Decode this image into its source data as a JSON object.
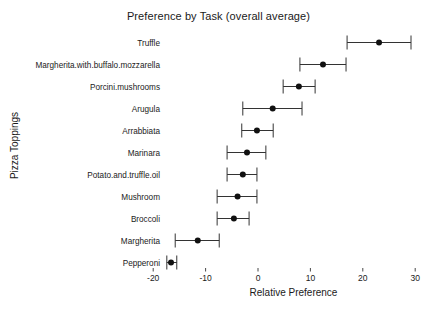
{
  "chart_data": {
    "type": "scatter",
    "title": "Preference by Task (overall average)",
    "xlabel": "Relative Preference",
    "ylabel": "Pizza Toppings",
    "xlim": [
      -22,
      31
    ],
    "xticks": [
      -20,
      -10,
      0,
      10,
      20,
      30
    ],
    "xtick_labels": [
      "-20",
      "-10",
      "0",
      "10",
      "20",
      "30"
    ],
    "grid": false,
    "legend": "none",
    "orientation": "horizontal",
    "marker": "filled-circle",
    "error_bars": "confidence-interval-with-caps",
    "categories": [
      "Truffle",
      "Margherita.with.buffalo.mozzarella",
      "Porcini.mushrooms",
      "Arugula",
      "Arrabbiata",
      "Marinara",
      "Potato.and.truffle.oil",
      "Mushroom",
      "Broccoli",
      "Margherita",
      "Pepperoni"
    ],
    "values": [
      23.1,
      12.4,
      7.8,
      2.8,
      -0.2,
      -2.1,
      -2.9,
      -3.9,
      -4.6,
      -11.5,
      -16.6
    ],
    "ci_low": [
      17.0,
      8.0,
      4.8,
      -2.9,
      -3.1,
      -5.9,
      -5.9,
      -7.8,
      -7.8,
      -15.8,
      -17.4
    ],
    "ci_high": [
      29.2,
      16.8,
      10.9,
      8.4,
      2.9,
      1.5,
      -0.2,
      -0.2,
      -1.7,
      -7.4,
      -15.5
    ],
    "series_name": "overall average",
    "colors": {
      "point": "#111111",
      "line": "#333333",
      "text": "#1a1a1a",
      "background": "#ffffff"
    }
  }
}
